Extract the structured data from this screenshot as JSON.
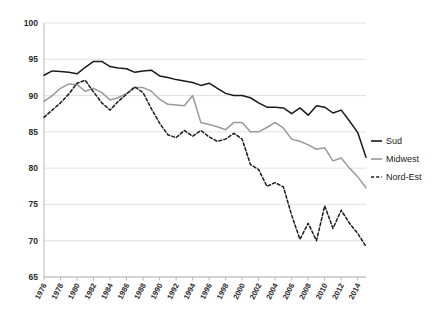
{
  "chart_data": {
    "type": "line",
    "title": "",
    "subtitle": "",
    "xlabel": "",
    "ylabel": "",
    "xlim": [
      1976,
      2015
    ],
    "ylim": [
      65,
      100
    ],
    "ytick_step": 5,
    "xtick_step": 2,
    "grid": true,
    "legend_position": "right",
    "ticks": {
      "y": [
        "65",
        "70",
        "75",
        "80",
        "85",
        "90",
        "95",
        "100"
      ],
      "x": [
        "1976",
        "1978",
        "1980",
        "1982",
        "1984",
        "1986",
        "1988",
        "1990",
        "1992",
        "1994",
        "1996",
        "1998",
        "2000",
        "2002",
        "2004",
        "2006",
        "2008",
        "2010",
        "2012",
        "2014"
      ]
    },
    "x": [
      1976,
      1977,
      1978,
      1979,
      1980,
      1981,
      1982,
      1983,
      1984,
      1985,
      1986,
      1987,
      1988,
      1989,
      1990,
      1991,
      1992,
      1993,
      1994,
      1995,
      1996,
      1997,
      1998,
      1999,
      2000,
      2001,
      2002,
      2003,
      2004,
      2005,
      2006,
      2007,
      2008,
      2009,
      2010,
      2011,
      2012,
      2013,
      2014,
      2015
    ],
    "series": [
      {
        "name": "Sud",
        "color": "#1a1a1a",
        "style": "solid",
        "values": [
          92.8,
          93.4,
          93.3,
          93.2,
          93.0,
          93.9,
          94.7,
          94.7,
          94.0,
          93.8,
          93.7,
          93.2,
          93.4,
          93.5,
          92.7,
          92.5,
          92.2,
          92.0,
          91.8,
          91.4,
          91.7,
          91.0,
          90.3,
          90.0,
          90.0,
          89.7,
          89.0,
          88.4,
          88.4,
          88.3,
          87.5,
          88.3,
          87.3,
          88.6,
          88.4,
          87.6,
          88.0,
          86.5,
          84.9,
          81.5
        ]
      },
      {
        "name": "Midwest",
        "color": "#9a9a9a",
        "style": "solid",
        "values": [
          89.2,
          90.0,
          91.0,
          91.6,
          91.5,
          90.6,
          91.0,
          90.4,
          89.4,
          89.7,
          90.3,
          91.1,
          91.1,
          90.6,
          89.5,
          88.8,
          88.7,
          88.6,
          90.0,
          86.3,
          86.0,
          85.7,
          85.3,
          86.3,
          86.3,
          85.0,
          85.0,
          85.6,
          86.3,
          85.5,
          84.0,
          83.7,
          83.2,
          82.6,
          82.8,
          81.0,
          81.4,
          80.0,
          78.8,
          77.3
        ]
      },
      {
        "name": "Nord-Est",
        "color": "#1a1a1a",
        "style": "dashed",
        "values": [
          87.0,
          88.0,
          89.0,
          90.2,
          91.7,
          92.1,
          90.5,
          89.0,
          88.0,
          89.2,
          90.2,
          91.2,
          90.4,
          88.2,
          86.2,
          84.6,
          84.2,
          85.2,
          84.4,
          85.2,
          84.3,
          83.7,
          84.0,
          84.8,
          84.0,
          80.5,
          79.8,
          77.5,
          78.0,
          77.4,
          73.5,
          70.2,
          72.4,
          70.0,
          74.8,
          71.7,
          74.2,
          72.4,
          71.0,
          69.2
        ]
      }
    ],
    "legend": [
      {
        "label": "Sud",
        "color": "#1a1a1a",
        "style": "solid"
      },
      {
        "label": "Midwest",
        "color": "#9a9a9a",
        "style": "solid"
      },
      {
        "label": "Nord-Est",
        "color": "#1a1a1a",
        "style": "dashed"
      }
    ]
  },
  "layout": {
    "plot_left": 44,
    "plot_right": 366,
    "plot_top": 23,
    "plot_bottom": 277
  }
}
